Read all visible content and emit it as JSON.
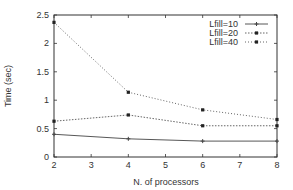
{
  "chart_data": {
    "type": "line",
    "title": "",
    "xlabel": "N. of processors",
    "ylabel": "Time (sec)",
    "x": [
      2,
      4,
      6,
      8
    ],
    "xlim": [
      2,
      8
    ],
    "ylim": [
      0,
      2.5
    ],
    "xticks": [
      2,
      3,
      4,
      5,
      6,
      7,
      8
    ],
    "yticks": [
      0,
      0.5,
      1,
      1.5,
      2,
      2.5
    ],
    "ytick_labels": [
      "0",
      "0.5",
      "1",
      "1.5",
      "2",
      "2.5"
    ],
    "grid": false,
    "legend_position": "top-right",
    "series": [
      {
        "name": "Lfill=10",
        "values": [
          0.4,
          0.32,
          0.28,
          0.28
        ],
        "dash": "",
        "marker": "plus",
        "color": "#444444"
      },
      {
        "name": "Lfill=20",
        "values": [
          0.63,
          0.74,
          0.55,
          0.55
        ],
        "dash": "1.5,1.5",
        "marker": "square",
        "color": "#555555"
      },
      {
        "name": "Lfill=40",
        "values": [
          2.37,
          1.14,
          0.83,
          0.66
        ],
        "dash": "1,2",
        "marker": "square",
        "color": "#555555"
      }
    ]
  }
}
